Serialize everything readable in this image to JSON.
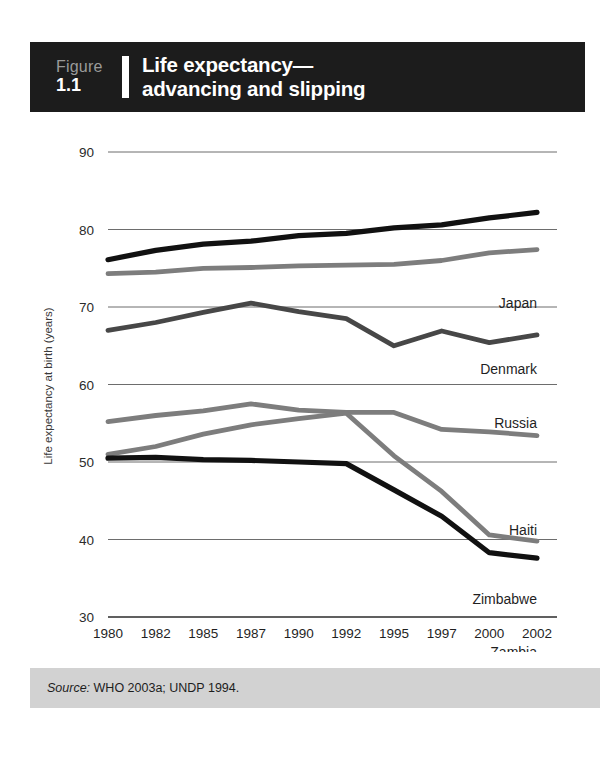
{
  "header": {
    "figure_word": "Figure",
    "figure_index": "1.1",
    "title_line1": "Life expectancy—",
    "title_line2": "advancing and slipping"
  },
  "source": {
    "label": "Source:",
    "text": " WHO 2003a; UNDP 1994."
  },
  "colors": {
    "header_background": "#1c1c1c",
    "page_background": "#ffffff",
    "source_band": "#d2d2d2",
    "gridline": "#6d6d6d",
    "black_series": "#111111",
    "dark_gray_series": "#474747",
    "mid_gray_series": "#7d7d7d"
  },
  "chart_data": {
    "type": "line",
    "title": "Life expectancy— advancing and slipping",
    "xlabel": "",
    "ylabel": "Life expectancy at birth (years)",
    "ylim": [
      30,
      90
    ],
    "yticks": [
      90,
      80,
      70,
      60,
      50,
      40,
      30
    ],
    "grid": true,
    "legend": "inline-right-labels",
    "categories": [
      "1980",
      "1982",
      "1985",
      "1987",
      "1990",
      "1992",
      "1995",
      "1997",
      "2000",
      "2002"
    ],
    "series": [
      {
        "name": "Japan",
        "color": "#111111",
        "values": [
          76.1,
          77.3,
          78.1,
          78.5,
          79.2,
          79.5,
          80.2,
          80.6,
          81.5,
          82.2
        ]
      },
      {
        "name": "Denmark",
        "color": "#7d7d7d",
        "values": [
          74.3,
          74.5,
          75.0,
          75.1,
          75.3,
          75.4,
          75.5,
          76.0,
          77.0,
          77.4
        ]
      },
      {
        "name": "Russia",
        "color": "#474747",
        "values": [
          67.0,
          68.0,
          69.3,
          70.5,
          69.4,
          68.5,
          65.0,
          66.9,
          65.4,
          66.4
        ]
      },
      {
        "name": "Haiti",
        "color": "#7d7d7d",
        "values": [
          55.2,
          56.0,
          56.6,
          57.5,
          56.7,
          56.4,
          56.4,
          54.2,
          53.9,
          53.4
        ]
      },
      {
        "name": "Zimbabwe",
        "color": "#7d7d7d",
        "values": [
          51.0,
          52.0,
          53.6,
          54.8,
          55.6,
          56.3,
          50.8,
          46.2,
          40.6,
          39.8
        ]
      },
      {
        "name": "Zambia",
        "color": "#111111",
        "values": [
          50.5,
          50.6,
          50.3,
          50.2,
          50.0,
          49.8,
          46.4,
          43.0,
          38.3,
          37.6
        ]
      }
    ]
  }
}
